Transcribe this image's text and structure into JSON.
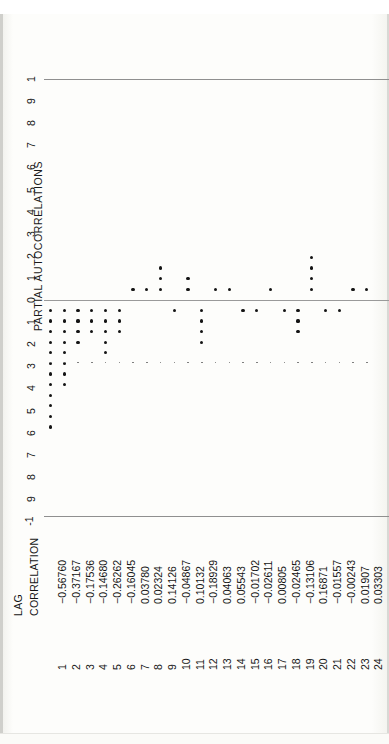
{
  "chart_data": {
    "type": "bar",
    "title": "PARTIAL AUTOCORRELATIONS",
    "ylabel": "PARTIAL AUTOCORRELATIONS",
    "xlabel": "LAG",
    "orientation": "horizontal-rotated",
    "ylim": [
      -1,
      1
    ],
    "grid": false,
    "reference_lines": [
      1,
      0,
      -1
    ],
    "ytick_labels": [
      "1",
      "9",
      "8",
      "7",
      "6",
      "5",
      "4",
      "3",
      "2",
      "1",
      "0",
      "1",
      "2",
      "3",
      "4",
      "5",
      "6",
      "7",
      "8",
      "9",
      "-1"
    ],
    "ytick_values": [
      1.0,
      0.9,
      0.8,
      0.7,
      0.6,
      0.5,
      0.4,
      0.3,
      0.2,
      0.1,
      0.0,
      -0.1,
      -0.2,
      -0.3,
      -0.4,
      -0.5,
      -0.6,
      -0.7,
      -0.8,
      -0.9,
      -1.0
    ],
    "categories": [
      1,
      2,
      3,
      4,
      5,
      6,
      7,
      8,
      9,
      10,
      11,
      12,
      13,
      14,
      15,
      16,
      17,
      18,
      19,
      20,
      21,
      22,
      23,
      24
    ],
    "values": [
      -0.5676,
      -0.37167,
      -0.17536,
      -0.1468,
      -0.26262,
      -0.16045,
      0.0378,
      0.02324,
      0.14126,
      -0.04867,
      0.10132,
      -0.18929,
      0.04063,
      0.05543,
      -0.01702,
      -0.02611,
      0.00805,
      -0.02465,
      -0.13106,
      0.16871,
      -0.01557,
      -0.00243,
      0.01907,
      0.03303
    ]
  },
  "plot": {
    "axis_title": "PARTIAL AUTOCORRELATIONS",
    "ticks": [
      "1",
      "9",
      "8",
      "7",
      "6",
      "5",
      "4",
      "3",
      "2",
      "1",
      "0",
      "1",
      "2",
      "3",
      "4",
      "5",
      "6",
      "7",
      "8",
      "9",
      "-1"
    ]
  },
  "table": {
    "header_lag": "LAG",
    "header_correlation": "CORRELATION",
    "rows": [
      {
        "lag": "1",
        "correlation": "-0.56760"
      },
      {
        "lag": "2",
        "correlation": "-0.37167"
      },
      {
        "lag": "3",
        "correlation": "-0.17536"
      },
      {
        "lag": "4",
        "correlation": "-0.14680"
      },
      {
        "lag": "5",
        "correlation": "-0.26262"
      },
      {
        "lag": "6",
        "correlation": "-0.16045"
      },
      {
        "lag": "7",
        "correlation": "0.03780"
      },
      {
        "lag": "8",
        "correlation": "0.02324"
      },
      {
        "lag": "9",
        "correlation": "0.14126"
      },
      {
        "lag": "10",
        "correlation": "-0.04867"
      },
      {
        "lag": "11",
        "correlation": "0.10132"
      },
      {
        "lag": "12",
        "correlation": "-0.18929"
      },
      {
        "lag": "13",
        "correlation": "0.04063"
      },
      {
        "lag": "14",
        "correlation": "0.05543"
      },
      {
        "lag": "15",
        "correlation": "-0.01702"
      },
      {
        "lag": "16",
        "correlation": "-0.02611"
      },
      {
        "lag": "17",
        "correlation": "0.00805"
      },
      {
        "lag": "18",
        "correlation": "-0.02465"
      },
      {
        "lag": "19",
        "correlation": "-0.13106"
      },
      {
        "lag": "20",
        "correlation": "0.16871"
      },
      {
        "lag": "21",
        "correlation": "-0.01557"
      },
      {
        "lag": "22",
        "correlation": "-0.00243"
      },
      {
        "lag": "23",
        "correlation": "0.01907"
      },
      {
        "lag": "24",
        "correlation": "0.03303"
      }
    ]
  }
}
